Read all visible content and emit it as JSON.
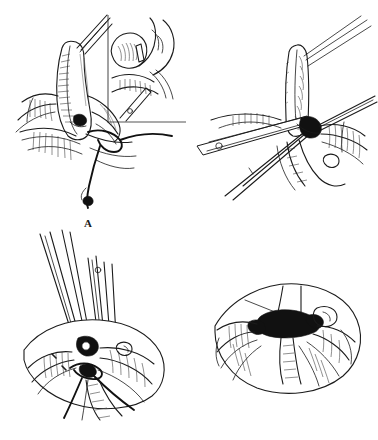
{
  "figure": {
    "background_color": "#ffffff",
    "ink_color": "#1b1b1b",
    "panel_count": 4,
    "layout": "2x2 grid",
    "style": "pen-and-ink line drawing"
  },
  "panels": [
    {
      "id": "a",
      "label": "A",
      "label_position": "below-center",
      "caption": "",
      "has_inset": true,
      "inset": {
        "frame_style": "L-shaped border (left and bottom rules)",
        "frame_color": "#555555",
        "content": "magnified view of tubular structure with instrument tip"
      },
      "elements": [
        "tubular organ",
        "instrument tips",
        "suture loop",
        "suture tail",
        "mesentery fan",
        "serosal hatching"
      ]
    },
    {
      "id": "b",
      "label": "B",
      "label_position": "below-center",
      "caption": "",
      "has_inset": false,
      "elements": [
        "vertical tubular stump",
        "three suture strands",
        "clamp with rivet",
        "forceps",
        "tissue folds",
        "knot"
      ]
    },
    {
      "id": "c",
      "label": "C",
      "label_position": "below-center",
      "caption": "",
      "has_inset": false,
      "elements": [
        "two instrument pairs",
        "forceps with rivet",
        "stump",
        "purse-string suture",
        "suture tails",
        "tissue fan"
      ]
    },
    {
      "id": "d",
      "label": "D",
      "label_position": "below-center",
      "caption": "",
      "has_inset": false,
      "elements": [
        "closed inverted stump",
        "dark knot cluster",
        "radiating tissue folds",
        "suture loop"
      ]
    }
  ]
}
